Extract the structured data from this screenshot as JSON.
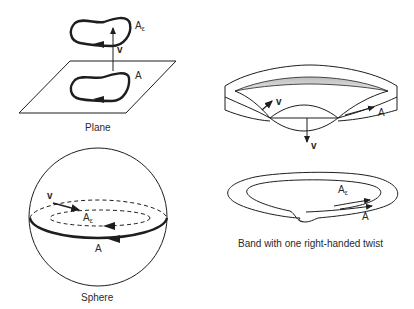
{
  "figures": {
    "plane": {
      "caption": "Plane",
      "labels": {
        "curve_shifted": "A",
        "curve_shifted_sub": "ε",
        "vector": "v",
        "curve": "A"
      }
    },
    "sphere": {
      "caption": "Sphere",
      "labels": {
        "vector": "v",
        "curve_shifted": "A",
        "curve_shifted_sub": "ε",
        "curve": "A"
      }
    },
    "band": {
      "caption": "Band with one right-handed twist",
      "labels": {
        "vector_top": "v",
        "curve_top": "A",
        "vector_bottom": "v",
        "curve_shifted": "A",
        "curve_shifted_sub": "ε",
        "curve": "A"
      }
    }
  },
  "colors": {
    "ink": "#1e1e1e",
    "shade": "#c8c8c8",
    "background": "#ffffff"
  }
}
